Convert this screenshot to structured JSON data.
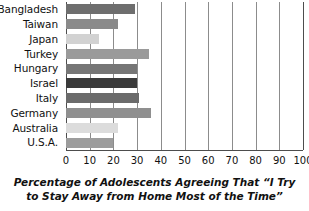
{
  "chart_data": {
    "type": "bar",
    "orientation": "horizontal",
    "title": "",
    "caption_line1": "Percentage of Adolescents Agreeing That “I Try",
    "caption_line2": "to Stay Away from Home Most of the Time”",
    "xlabel": "",
    "ylabel": "",
    "xlim": [
      0,
      100
    ],
    "xticks": [
      0,
      10,
      20,
      30,
      40,
      50,
      60,
      70,
      80,
      90,
      100
    ],
    "grid": true,
    "legend": "none",
    "categories": [
      "Bangladesh",
      "Taiwan",
      "Japan",
      "Turkey",
      "Hungary",
      "Israel",
      "Italy",
      "Germany",
      "Australia",
      "U.S.A."
    ],
    "values": [
      29,
      22,
      14,
      35,
      30,
      30,
      31,
      36,
      22,
      20
    ],
    "bar_colors": [
      "#6e6e6e",
      "#8a8a8a",
      "#d2d2d2",
      "#9a9a9a",
      "#767676",
      "#3a3a3a",
      "#6b6b6b",
      "#8f8f8f",
      "#dcdcdc",
      "#9c9c9c"
    ]
  },
  "axis": {
    "line_color": "#4d4d4d",
    "gridline_color": "#8c8c8c"
  }
}
